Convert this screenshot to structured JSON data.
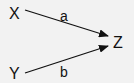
{
  "diagram": {
    "nodes": [
      {
        "id": "X",
        "label": "X"
      },
      {
        "id": "Y",
        "label": "Y"
      },
      {
        "id": "Z",
        "label": "Z"
      }
    ],
    "edges": [
      {
        "from": "X",
        "to": "Z",
        "label": "a"
      },
      {
        "from": "Y",
        "to": "Z",
        "label": "b"
      }
    ]
  },
  "colors": {
    "background": "#f2f2f2",
    "stroke": "#111111"
  }
}
